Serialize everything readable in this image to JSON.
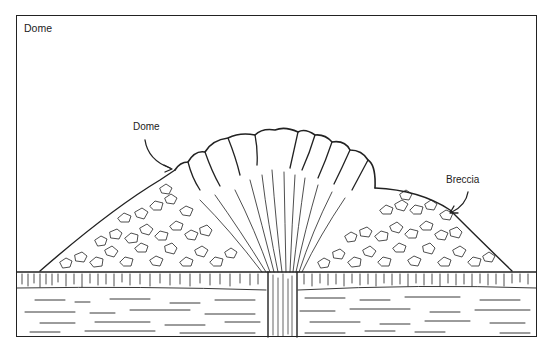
{
  "figure": {
    "title": "Dome",
    "labels": {
      "dome": "Dome",
      "breccia": "Breccia"
    },
    "colors": {
      "line": "#222222",
      "background": "#ffffff"
    }
  }
}
